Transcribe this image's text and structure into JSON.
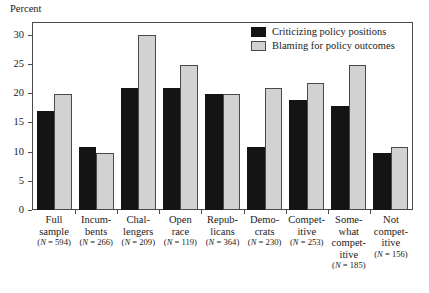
{
  "chart_data": {
    "type": "bar",
    "title": "",
    "xlabel": "",
    "ylabel": "Percent",
    "ylim": [
      0,
      32
    ],
    "yticks": [
      0,
      5,
      10,
      15,
      20,
      25,
      30
    ],
    "grid": false,
    "legend_position": "top-right",
    "categories": [
      "Full sample",
      "Incumbents",
      "Challengers",
      "Open race",
      "Republicans",
      "Democrats",
      "Competitive",
      "Somewhat competitive",
      "Not competitive"
    ],
    "category_lines": [
      [
        "Full",
        "sample"
      ],
      [
        "Incum-",
        "bents"
      ],
      [
        "Chal-",
        "lengers"
      ],
      [
        "Open",
        "race"
      ],
      [
        "Repub-",
        "licans"
      ],
      [
        "Demo-",
        "crats"
      ],
      [
        "Compet-",
        "itive"
      ],
      [
        "Some-",
        "what",
        "compet-",
        "itive"
      ],
      [
        "Not",
        "compet-",
        "itive"
      ]
    ],
    "category_n": [
      "(N = 594)",
      "(N = 266)",
      "(N = 209)",
      "(N = 119)",
      "(N = 364)",
      "(N = 230)",
      "(N = 253)",
      "(N = 185)",
      "(N = 156)"
    ],
    "series": [
      {
        "name": "Criticizing policy positions",
        "color": "#141414",
        "values": [
          17.0,
          10.8,
          20.9,
          20.9,
          19.8,
          10.8,
          18.8,
          17.8,
          9.7
        ]
      },
      {
        "name": "Blaming for policy outcomes",
        "color": "#d2d2d2",
        "values": [
          19.8,
          9.8,
          29.9,
          24.9,
          19.8,
          20.8,
          21.7,
          24.9,
          10.8
        ]
      }
    ]
  },
  "legend": {
    "items": [
      {
        "label": "Criticizing policy positions"
      },
      {
        "label": "Blaming for policy outcomes"
      }
    ]
  }
}
